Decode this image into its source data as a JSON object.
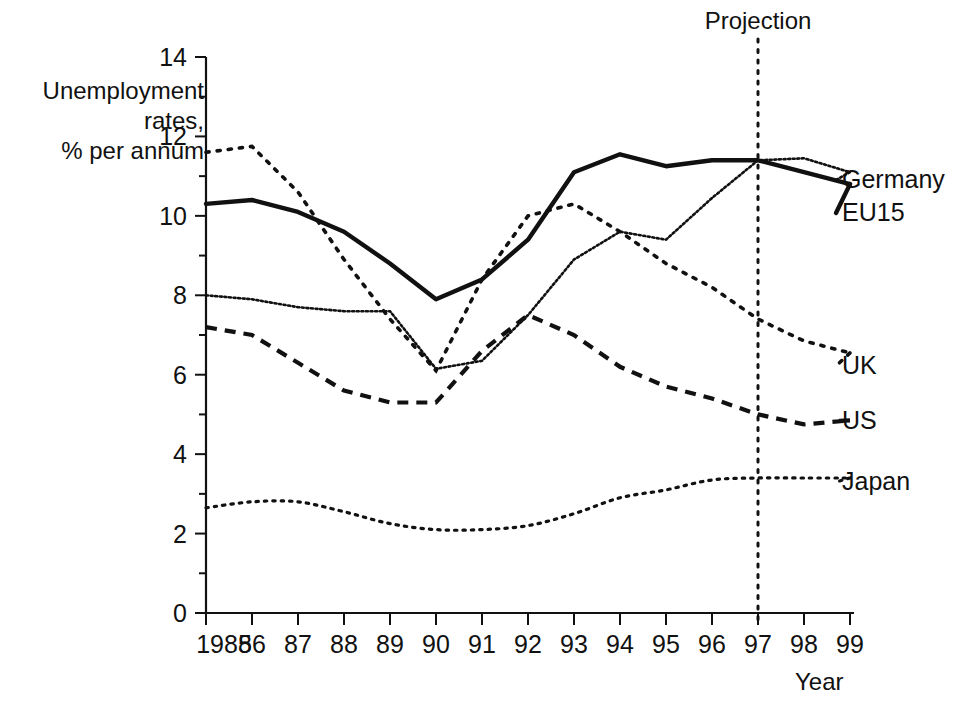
{
  "chart_data": {
    "type": "line",
    "title": "",
    "ylabel": "Unemployment\nrates,\n% per annum",
    "xlabel": "Year",
    "x": [
      1985,
      1986,
      1987,
      1988,
      1989,
      1990,
      1991,
      1992,
      1993,
      1994,
      1995,
      1996,
      1997,
      1998,
      1999
    ],
    "categories": [
      "1985",
      "86",
      "87",
      "88",
      "89",
      "90",
      "91",
      "92",
      "93",
      "94",
      "95",
      "96",
      "97",
      "98",
      "99"
    ],
    "xlim": [
      1985,
      1999
    ],
    "ylim": [
      0,
      14
    ],
    "yticks": [
      0,
      2,
      4,
      6,
      8,
      10,
      12,
      14
    ],
    "ytick_labels": [
      "0",
      "2",
      "4",
      "6",
      "8",
      "10",
      "12",
      "14"
    ],
    "minor_yticks": [
      1,
      3,
      5,
      7,
      9,
      11,
      13
    ],
    "grid": false,
    "legend_position": "right-inline",
    "annotations": [
      {
        "name": "projection-divider",
        "label": "Projection",
        "x": 1997,
        "style": "vertical-dotted-line"
      }
    ],
    "series": [
      {
        "name": "EU15",
        "style": "solid-thick",
        "values": [
          10.3,
          10.4,
          10.1,
          9.6,
          8.8,
          7.9,
          8.4,
          9.4,
          11.1,
          11.55,
          11.25,
          11.4,
          11.4,
          11.1,
          10.8
        ]
      },
      {
        "name": "Germany",
        "style": "fine-dotted",
        "values": [
          8.0,
          7.9,
          7.7,
          7.6,
          7.6,
          6.15,
          6.35,
          7.5,
          8.9,
          9.6,
          9.4,
          10.45,
          11.4,
          11.45,
          11.1
        ]
      },
      {
        "name": "UK",
        "style": "dotted",
        "values": [
          11.6,
          11.75,
          10.6,
          8.9,
          7.4,
          6.1,
          8.4,
          10.0,
          10.3,
          9.6,
          8.8,
          8.2,
          7.4,
          6.85,
          6.55
        ]
      },
      {
        "name": "US",
        "style": "dashed",
        "values": [
          7.2,
          7.0,
          6.3,
          5.6,
          5.3,
          5.3,
          6.6,
          7.5,
          7.0,
          6.2,
          5.7,
          5.4,
          5.0,
          4.75,
          4.85
        ]
      },
      {
        "name": "Japan",
        "style": "fine-dotted",
        "values": [
          2.65,
          2.8,
          2.8,
          2.55,
          2.25,
          2.1,
          2.1,
          2.2,
          2.5,
          2.9,
          3.1,
          3.35,
          3.4,
          3.4,
          3.4
        ]
      }
    ]
  },
  "axis": {
    "y_title_lines": "Unemployment\nrates,\n% per annum",
    "x_title": "Year"
  },
  "series_labels": [
    {
      "key": "germany",
      "text": "Germany"
    },
    {
      "key": "eu15",
      "text": "EU15"
    },
    {
      "key": "uk",
      "text": "UK"
    },
    {
      "key": "us",
      "text": "US"
    },
    {
      "key": "japan",
      "text": "Japan"
    }
  ],
  "projection": {
    "label": "Projection"
  },
  "colors": {
    "ink": "#111111",
    "background": "#ffffff"
  }
}
